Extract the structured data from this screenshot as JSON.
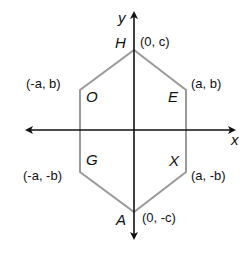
{
  "diagram": {
    "type": "coordinate-hexagon",
    "axes": {
      "x_label": "x",
      "y_label": "y"
    },
    "vertices": [
      {
        "name": "H",
        "coord": "(0, c)"
      },
      {
        "name": "E",
        "coord": "(a, b)"
      },
      {
        "name": "X",
        "coord": "(a, -b)"
      },
      {
        "name": "A",
        "coord": "(0, -c)"
      },
      {
        "name": "G",
        "coord": "(-a, -b)"
      },
      {
        "name": "O",
        "coord": "(-a, b)"
      }
    ],
    "colors": {
      "axis": "#111111",
      "polygon": "#9a9a9a"
    }
  }
}
